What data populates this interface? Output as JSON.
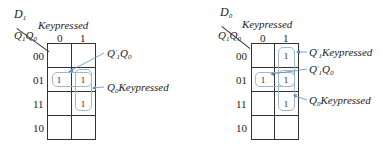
{
  "maps": [
    {
      "output": "D",
      "output_sub": "1",
      "col_var": "Keypressed",
      "row_vars": "Q",
      "col_labels": [
        "0",
        "1"
      ],
      "row_labels": [
        "00",
        "01",
        "11",
        "10"
      ],
      "cells": [
        [
          "",
          ""
        ],
        [
          "1",
          "1"
        ],
        [
          "",
          "1"
        ],
        [
          "",
          ""
        ]
      ],
      "annotations": [
        {
          "text_a": "Q",
          "sup": "′",
          "sub1": "1",
          "text_b": "Q",
          "sub2": "0",
          "label": "Q'1Q0"
        },
        {
          "text_a": "Q",
          "sub1": "0",
          "text_b": "Keypressed",
          "label": "Q0Keypressed"
        }
      ]
    },
    {
      "output": "D",
      "output_sub": "0",
      "col_var": "Keypressed",
      "row_vars": "Q",
      "col_labels": [
        "0",
        "1"
      ],
      "row_labels": [
        "00",
        "01",
        "11",
        "10"
      ],
      "cells": [
        [
          "",
          "1"
        ],
        [
          "1",
          "1"
        ],
        [
          "",
          "1"
        ],
        [
          "",
          ""
        ]
      ],
      "annotations": [
        {
          "text_a": "Q",
          "sup": "′",
          "sub1": "1",
          "text_b": "Keypressed",
          "label": "Q'1Keypressed"
        },
        {
          "text_a": "Q",
          "sup": "′",
          "sub1": "1",
          "text_b": "Q",
          "sub2": "0",
          "label": "Q'1Q0"
        },
        {
          "text_a": "Q",
          "sub1": "0",
          "text_b": "Keypressed",
          "label": "Q0Keypressed"
        }
      ]
    }
  ],
  "subs": {
    "one": "1",
    "zero": "0"
  },
  "loop_color": "#9fb6cc",
  "arrow_color": "#5a8fc0"
}
